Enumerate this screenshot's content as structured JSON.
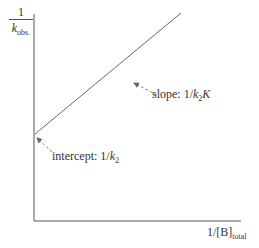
{
  "diagram": {
    "type": "double-reciprocal plot",
    "y_axis": {
      "label_numerator": "1",
      "label_denominator_symbol": "k",
      "label_denominator_sub": "obs."
    },
    "x_axis": {
      "label_main": "1/[B]",
      "label_sub": "total"
    },
    "annotations": {
      "slope": {
        "prefix": "slope: 1/",
        "k": "k",
        "k_sub": "2",
        "K": "K"
      },
      "intercept": {
        "prefix": "intercept: 1/",
        "k": "k",
        "k_sub": "2"
      }
    },
    "colors": {
      "axis": "#555555",
      "line": "#666666",
      "arrow": "#888888",
      "text": "#333333"
    }
  }
}
